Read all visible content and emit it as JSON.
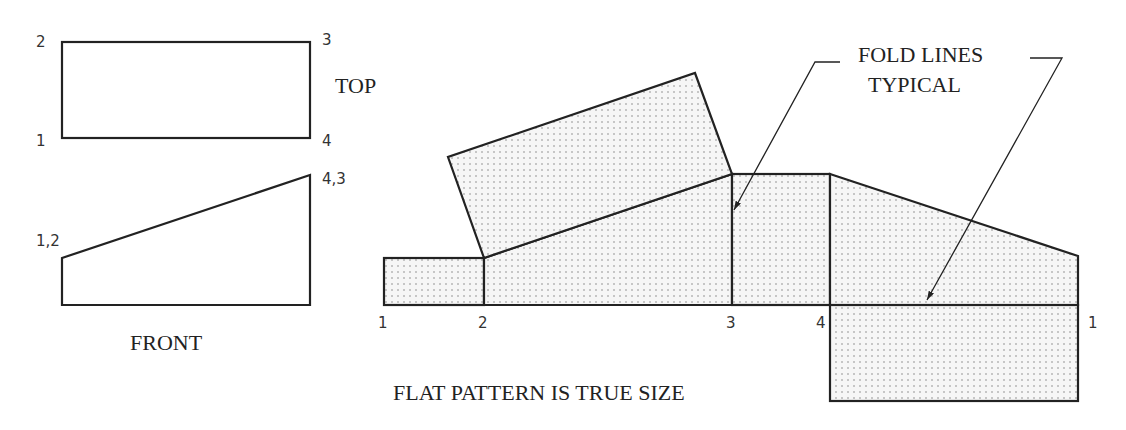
{
  "top_view": {
    "title": "TOP",
    "points": [
      {
        "label": "2",
        "x": 62,
        "y": 42
      },
      {
        "label": "3",
        "x": 310,
        "y": 42
      },
      {
        "label": "1",
        "x": 62,
        "y": 138
      },
      {
        "label": "4",
        "x": 310,
        "y": 138
      }
    ]
  },
  "front_view": {
    "title": "FRONT",
    "labels": {
      "left": "1,2",
      "right": "4,3"
    }
  },
  "flat_pattern": {
    "caption": "FLAT PATTERN IS TRUE SIZE",
    "bottom_labels": [
      "1",
      "2",
      "3",
      "4",
      "1"
    ]
  },
  "annotation": {
    "line1": "FOLD LINES",
    "line2": "TYPICAL"
  },
  "colors": {
    "line": "#222222",
    "dot": "#8a8a8a",
    "background": "#ffffff"
  }
}
